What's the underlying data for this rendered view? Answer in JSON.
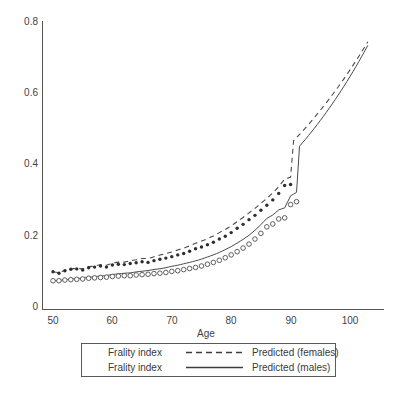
{
  "chart_data": {
    "type": "scatter",
    "title": "",
    "xlabel": "Age",
    "ylabel": "",
    "xlim": [
      48,
      105
    ],
    "ylim": [
      0,
      0.8
    ],
    "grid": false,
    "x_ticks": [
      "50",
      "60",
      "70",
      "80",
      "90",
      "100"
    ],
    "x_tick_values": [
      50,
      60,
      70,
      80,
      90,
      100
    ],
    "y_ticks": [
      "0",
      "0.2",
      "0.4",
      "0.6",
      "0.8"
    ],
    "y_tick_values": [
      0,
      0.2,
      0.4,
      0.6,
      0.8
    ],
    "legend_position": "below-axes",
    "series": [
      {
        "name": "Frality index",
        "label": "Frality index",
        "predicted_label": "Predicted (females)",
        "group": "females",
        "marker": "filled-dot",
        "line_style": "dashed",
        "color": "#2e2e2e",
        "x": [
          50,
          51,
          52,
          53,
          54,
          55,
          56,
          57,
          58,
          59,
          60,
          61,
          62,
          63,
          64,
          65,
          66,
          67,
          68,
          69,
          70,
          71,
          72,
          73,
          74,
          75,
          76,
          77,
          78,
          79,
          80,
          81,
          82,
          83,
          84,
          85,
          86,
          87,
          88,
          89,
          90
        ],
        "values": [
          0.105,
          0.101,
          0.108,
          0.112,
          0.113,
          0.11,
          0.116,
          0.118,
          0.121,
          0.118,
          0.124,
          0.126,
          0.125,
          0.128,
          0.13,
          0.133,
          0.131,
          0.136,
          0.14,
          0.143,
          0.147,
          0.152,
          0.156,
          0.162,
          0.169,
          0.174,
          0.18,
          0.187,
          0.196,
          0.204,
          0.214,
          0.226,
          0.237,
          0.25,
          0.262,
          0.276,
          0.29,
          0.305,
          0.323,
          0.345,
          0.348
        ]
      },
      {
        "name": "Frality index",
        "label": "Frality index",
        "predicted_label": "Predicted (males)",
        "group": "males",
        "marker": "open-circle",
        "line_style": "solid",
        "color": "#4d4d4d",
        "x": [
          50,
          51,
          52,
          53,
          54,
          55,
          56,
          57,
          58,
          59,
          60,
          61,
          62,
          63,
          64,
          65,
          66,
          67,
          68,
          69,
          70,
          71,
          72,
          73,
          74,
          75,
          76,
          77,
          78,
          79,
          80,
          81,
          82,
          83,
          84,
          85,
          86,
          87,
          88,
          89,
          90,
          91
        ],
        "values": [
          0.08,
          0.08,
          0.082,
          0.083,
          0.084,
          0.085,
          0.087,
          0.088,
          0.089,
          0.09,
          0.092,
          0.093,
          0.094,
          0.094,
          0.096,
          0.097,
          0.098,
          0.1,
          0.101,
          0.103,
          0.106,
          0.108,
          0.111,
          0.114,
          0.117,
          0.121,
          0.126,
          0.131,
          0.137,
          0.144,
          0.152,
          0.161,
          0.171,
          0.182,
          0.196,
          0.212,
          0.23,
          0.238,
          0.252,
          0.255,
          0.292,
          0.3
        ]
      }
    ],
    "fitted_curves": [
      {
        "name": "Predicted (females)",
        "line_style": "dashed",
        "x_range": [
          50,
          103
        ],
        "endpoint_value": 0.745
      },
      {
        "name": "Predicted (males)",
        "line_style": "solid",
        "x_range": [
          50,
          103
        ],
        "endpoint_value": 0.735
      }
    ]
  },
  "axes": {
    "x_axis_title": "Age",
    "y_tick_labels": [
      "0.8",
      "0.6",
      "0.4",
      "0.2",
      "0"
    ],
    "x_tick_labels": [
      "50",
      "60",
      "70",
      "80",
      "90",
      "100"
    ]
  },
  "legend": {
    "rows": [
      {
        "series_label": "Frality index",
        "sample": "dashed-line",
        "predicted_label": "Predicted (females)"
      },
      {
        "series_label": "Frality index",
        "sample": "solid-line",
        "predicted_label": "Predicted (males)"
      }
    ]
  }
}
